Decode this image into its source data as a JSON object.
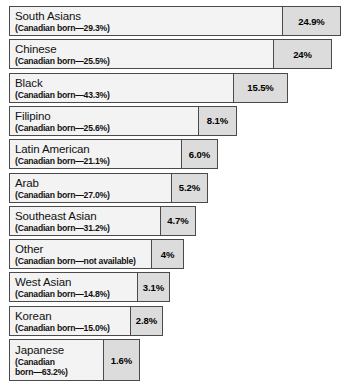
{
  "chart_data": {
    "type": "bar",
    "orientation": "horizontal",
    "title": "",
    "xlabel": "",
    "ylabel": "",
    "grid": false,
    "legend": null,
    "value_suffix": "%",
    "xlim": [
      0,
      24.9
    ],
    "categories": [
      "South Asians",
      "Chinese",
      "Black",
      "Filipino",
      "Latin American",
      "Arab",
      "Southeast Asian",
      "Other",
      "West Asian",
      "Korean",
      "Japanese"
    ],
    "values": [
      24.9,
      24,
      15.5,
      8.1,
      6.0,
      5.2,
      4.7,
      4,
      3.1,
      2.8,
      1.6
    ],
    "value_labels": [
      "24.9%",
      "24%",
      "15.5%",
      "8.1%",
      "6.0%",
      "5.2%",
      "4.7%",
      "4%",
      "3.1%",
      "2.8%",
      "1.6%"
    ],
    "sublabels": [
      "(Canadian born—29.3%)",
      "(Canadian born—25.5%)",
      "(Canadian born—43.3%)",
      "(Canadian born—25.6%)",
      "(Canadian born—21.1%)",
      "(Canadian born—27.0%)",
      "(Canadian born—31.2%)",
      "(Canadian born—not available)",
      "(Canadian born—14.8%)",
      "(Canadian born—15.0%)",
      "(Canadian born—63.2%)"
    ],
    "canadian_born": [
      29.3,
      25.5,
      43.3,
      25.6,
      21.1,
      27.0,
      31.2,
      null,
      14.8,
      15.0,
      63.2
    ]
  },
  "rows": [
    {
      "name": "South Asians",
      "sub": "(Canadian born—29.3%)",
      "value": "24.9%"
    },
    {
      "name": "Chinese",
      "sub": "(Canadian born—25.5%)",
      "value": "24%"
    },
    {
      "name": "Black",
      "sub": "(Canadian born—43.3%)",
      "value": "15.5%"
    },
    {
      "name": "Filipino",
      "sub": "(Canadian born—25.6%)",
      "value": "8.1%"
    },
    {
      "name": "Latin American",
      "sub": "(Canadian born—21.1%)",
      "value": "6.0%"
    },
    {
      "name": "Arab",
      "sub": "(Canadian born—27.0%)",
      "value": "5.2%"
    },
    {
      "name": "Southeast Asian",
      "sub": "(Canadian born—31.2%)",
      "value": "4.7%"
    },
    {
      "name": "Other",
      "sub": "(Canadian born—not available)",
      "value": "4%"
    },
    {
      "name": "West Asian",
      "sub": "(Canadian born—14.8%)",
      "value": "3.1%"
    },
    {
      "name": "Korean",
      "sub": "(Canadian born—15.0%)",
      "value": "2.8%"
    },
    {
      "name": "Japanese",
      "sub": "(Canadian\nborn—63.2%)",
      "value": "1.6%"
    }
  ],
  "footnote": {
    "text": ""
  }
}
